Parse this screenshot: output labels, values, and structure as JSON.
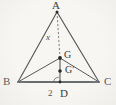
{
  "figure": {
    "type": "geometry-diagram",
    "background_color": "#f7f6f3",
    "stroke_color": "#55585a",
    "base_stroke_color": "#6a6d70",
    "point_color": "#2b2b2b"
  },
  "vertices": {
    "a_label": "A",
    "b_label": "B",
    "c_label": "C",
    "d_label": "D"
  },
  "points": {
    "g_label": "G",
    "g_prime_label": "G′"
  },
  "measures": {
    "x_label": "x",
    "two_label": "2"
  },
  "geometry": {
    "a": {
      "x": 57,
      "y": 12
    },
    "b": {
      "x": 18,
      "y": 82
    },
    "c": {
      "x": 99,
      "y": 82
    },
    "d": {
      "x": 60,
      "y": 82
    },
    "g": {
      "x": 60,
      "y": 58
    },
    "g_prime": {
      "x": 60,
      "y": 71
    }
  }
}
